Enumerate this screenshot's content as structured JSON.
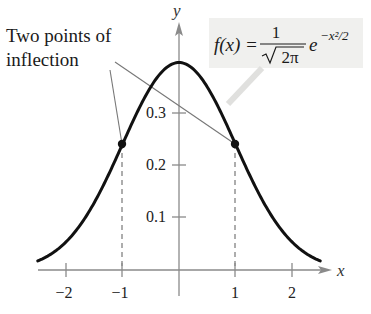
{
  "chart_data": {
    "type": "line",
    "title": "",
    "function": "f(x) = 1/sqrt(2*pi) * e^(-x^2/2)",
    "xlabel": "x",
    "ylabel": "y",
    "xlim": [
      -2.5,
      2.5
    ],
    "ylim": [
      0,
      0.42
    ],
    "x_ticks": [
      -2,
      -1,
      1,
      2
    ],
    "x_tick_labels": [
      "−2",
      "−1",
      "1",
      "2"
    ],
    "y_ticks": [
      0.1,
      0.2,
      0.3
    ],
    "y_tick_labels": [
      "0.1",
      "0.2",
      "0.3"
    ],
    "grid": false,
    "series": [
      {
        "name": "f(x)",
        "x": [
          -2.5,
          -2.0,
          -1.5,
          -1.0,
          -0.5,
          0.0,
          0.5,
          1.0,
          1.5,
          2.0,
          2.5
        ],
        "values": [
          0.018,
          0.054,
          0.13,
          0.242,
          0.352,
          0.399,
          0.352,
          0.242,
          0.13,
          0.054,
          0.018
        ]
      }
    ],
    "points": [
      {
        "x": -1,
        "y": 0.242,
        "label": "inflection point"
      },
      {
        "x": 1,
        "y": 0.242,
        "label": "inflection point"
      }
    ],
    "annotations": [
      {
        "text": "Two points of inflection",
        "points_to": [
          [
            -1,
            0.242
          ],
          [
            1,
            0.242
          ]
        ]
      },
      {
        "text": "f(x) = 1/√(2π) e^(−x²/2)",
        "type": "formula-label"
      }
    ]
  },
  "labels": {
    "annotation_line1": "Two points of",
    "annotation_line2": "inflection",
    "x_axis": "x",
    "y_axis": "y",
    "formula_lhs": "f(x) = ",
    "formula_num": "1",
    "formula_den": "2π",
    "formula_e": "e",
    "formula_exp": "−x²/2"
  },
  "colors": {
    "curve": "#111111",
    "axis": "#888888",
    "dashed": "#777777",
    "formula_bg": "#f0f0ee",
    "text": "#222222"
  }
}
